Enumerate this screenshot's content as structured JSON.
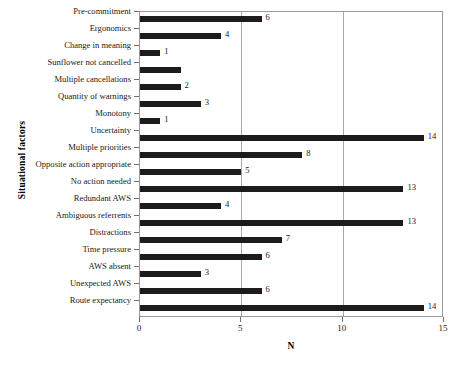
{
  "chart_data": {
    "type": "bar",
    "orientation": "horizontal",
    "title": "",
    "xlabel": "N",
    "ylabel": "Situational factors",
    "xlim": [
      0,
      15
    ],
    "xticks": [
      0,
      5,
      10,
      15
    ],
    "xtick_labels": [
      "0",
      "5",
      "10",
      "15"
    ],
    "grid": true,
    "grid_axis": "x",
    "legend": null,
    "bar_color": "#1c1c1c",
    "categories": [
      "Pre-commitment",
      "Ergonomics",
      "Change in meaning",
      "Sunflower not cancelled",
      "Multiple cancellations",
      "Quantity of warnings",
      "Monotony",
      "Uncertainty",
      "Multiple priorities",
      "Opposite action appropriate",
      "No action needed",
      "Redundant AWS",
      "Ambiguous referrents",
      "Distractions",
      "Time pressure",
      "AWS absent",
      "Unexpected AWS",
      "Route expectancy"
    ],
    "values": [
      6,
      4,
      1,
      2,
      2,
      3,
      1,
      14,
      8,
      5,
      13,
      4,
      13,
      7,
      6,
      3,
      6,
      14
    ],
    "value_labels": [
      "6",
      "4",
      "1",
      "",
      "2",
      "3",
      "1",
      "14",
      "8",
      "5",
      "13",
      "4",
      "13",
      "7",
      "6",
      "3",
      "6",
      "14"
    ]
  }
}
